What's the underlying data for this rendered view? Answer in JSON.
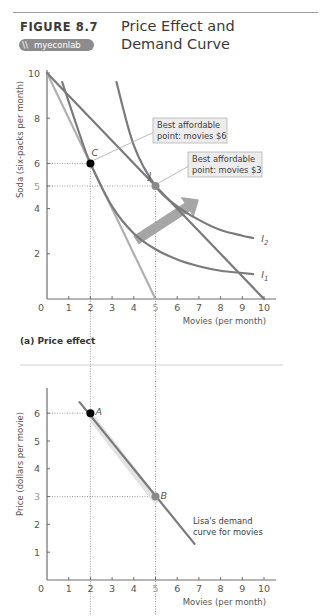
{
  "header": {
    "figure_label": "FIGURE 8.7",
    "logo_text": "myeconlab",
    "title_line1": "Price Effect and",
    "title_line2": "Demand Curve"
  },
  "colors": {
    "axis": "#6e6e6e",
    "curve_dark": "#7a7a7a",
    "curve_light": "#b0b0b0",
    "point_dark": "#000000",
    "point_grey": "#8a8a8a",
    "arrow": "#a6a6a6",
    "callout_bg": "#ececec"
  },
  "chart_data": [
    {
      "type": "line",
      "panel": "(a) Price effect",
      "xlabel": "Movies (per month)",
      "ylabel": "Soda (six-packs per month)",
      "xlim": [
        0,
        10
      ],
      "ylim": [
        0,
        10
      ],
      "x_ticks": [
        "0",
        "1",
        "2",
        "3",
        "4",
        "5",
        "6",
        "7",
        "8",
        "9",
        "10"
      ],
      "y_ticks": [
        "0",
        "2",
        "4",
        "5",
        "6",
        "8",
        "10"
      ],
      "grid": false,
      "series": [
        {
          "name": "Budget line (movies $6)",
          "style": "light",
          "points": [
            [
              0,
              10
            ],
            [
              5,
              0
            ]
          ]
        },
        {
          "name": "Budget line (movies $3)",
          "style": "dark",
          "points": [
            [
              0,
              10
            ],
            [
              10,
              0
            ]
          ]
        },
        {
          "name": "I1",
          "style": "dark",
          "points": [
            [
              0.7,
              9.6
            ],
            [
              1.5,
              7.3
            ],
            [
              2,
              6
            ],
            [
              3,
              4.1
            ],
            [
              4,
              2.9
            ],
            [
              5,
              2.2
            ],
            [
              6,
              1.75
            ],
            [
              7,
              1.45
            ],
            [
              8,
              1.25
            ],
            [
              9,
              1.15
            ],
            [
              9.5,
              1.1
            ]
          ]
        },
        {
          "name": "I2",
          "style": "dark",
          "points": [
            [
              3.2,
              9.6
            ],
            [
              4,
              6.8
            ],
            [
              5,
              5
            ],
            [
              6,
              4.1
            ],
            [
              7,
              3.5
            ],
            [
              8,
              3.05
            ],
            [
              9,
              2.8
            ],
            [
              9.5,
              2.7
            ]
          ]
        }
      ],
      "points": [
        {
          "label": "C",
          "x": 2,
          "y": 6,
          "style": "dark"
        },
        {
          "label": "J",
          "x": 5,
          "y": 5,
          "style": "grey"
        }
      ],
      "curve_labels": [
        "I1",
        "I2"
      ],
      "annotations": [
        {
          "text_line1": "Best affordable",
          "text_line2": "point: movies $6",
          "points_to": "C"
        },
        {
          "text_line1": "Best affordable",
          "text_line2": "point: movies $3",
          "points_to": "J"
        }
      ],
      "arrow": {
        "from": [
          4.1,
          2.6
        ],
        "to": [
          7.0,
          4.4
        ]
      }
    },
    {
      "type": "line",
      "xlabel": "Movies (per month)",
      "ylabel": "Price (dollars per movie)",
      "xlim": [
        0,
        10
      ],
      "ylim": [
        0,
        7
      ],
      "x_ticks": [
        "0",
        "1",
        "2",
        "3",
        "4",
        "5",
        "6",
        "7",
        "8",
        "9",
        "10"
      ],
      "y_ticks": [
        "1",
        "2",
        "3",
        "4",
        "5",
        "6"
      ],
      "grid": false,
      "series": [
        {
          "name": "Lisa's demand curve for movies",
          "style": "dark",
          "points": [
            [
              1.5,
              6.4
            ],
            [
              6.8,
              1.3
            ]
          ]
        }
      ],
      "points": [
        {
          "label": "A",
          "x": 2,
          "y": 6,
          "style": "dark"
        },
        {
          "label": "B",
          "x": 5,
          "y": 3,
          "style": "grey"
        }
      ],
      "annotations": [
        {
          "text_line1": "Lisa's demand",
          "text_line2": "curve for movies"
        }
      ]
    }
  ]
}
